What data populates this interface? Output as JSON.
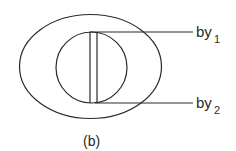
{
  "diagram": {
    "caption": "(b)",
    "labels": [
      {
        "text": "by",
        "subscript": "1"
      },
      {
        "text": "by",
        "subscript": "2"
      }
    ],
    "colors": {
      "line": "#2a2a2a",
      "background": "#ffffff"
    }
  }
}
